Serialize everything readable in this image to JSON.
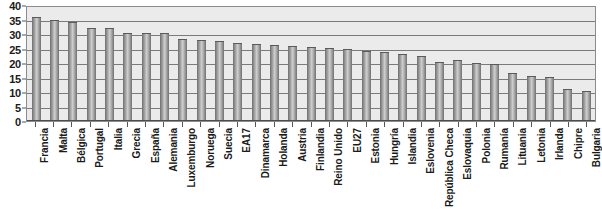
{
  "chart_data": {
    "type": "bar",
    "title": "",
    "subtitle": "",
    "xlabel": "",
    "ylabel": "",
    "ylim": [
      0,
      40
    ],
    "ytick_step": 5,
    "yticks": [
      "0",
      "5",
      "10",
      "15",
      "20",
      "25",
      "30",
      "35",
      "40"
    ],
    "grid": true,
    "legend": false,
    "legend_position": "none",
    "orientation": "vertical",
    "categories": [
      "Francia",
      "Malta",
      "Bélgica",
      "Portugal",
      "Italia",
      "Grecia",
      "España",
      "Alemania",
      "Luxemburgo",
      "Noruega",
      "Suecia",
      "EA17",
      "Dinamarca",
      "Holanda",
      "Austria",
      "Finlandia",
      "Reino Unido",
      "EU27",
      "Estonia",
      "Hungría",
      "Islandia",
      "Eslovenia",
      "República Checa",
      "Eslovaquia",
      "Polonia",
      "Rumanía",
      "Lituania",
      "Letonia",
      "Irlanda",
      "Chipre",
      "Bulgaria"
    ],
    "values": [
      36.0,
      35.0,
      34.0,
      32.0,
      32.2,
      30.5,
      30.2,
      30.3,
      28.4,
      27.8,
      27.5,
      27.0,
      26.5,
      26.2,
      26.0,
      25.5,
      25.3,
      24.8,
      24.0,
      23.8,
      23.0,
      22.5,
      20.5,
      21.0,
      20.0,
      19.8,
      16.5,
      15.5,
      15.2,
      11.0,
      10.5
    ],
    "colors": {
      "bar_light": "#cfcfcf",
      "bar_dark": "#6e6e6e",
      "plot_background": "#ebebeb",
      "gridline": "#7a7a7a",
      "axis": "#555555",
      "text": "#1a1a1a",
      "page_background": "#ffffff"
    }
  }
}
